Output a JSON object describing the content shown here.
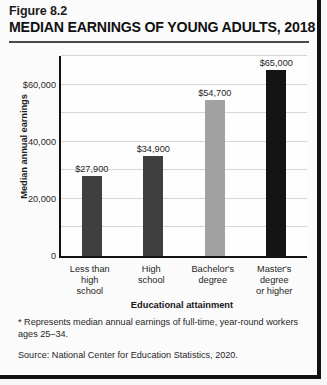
{
  "figure": {
    "number": "Figure 8.2",
    "title": "MEDIAN EARNINGS OF YOUNG ADULTS, 2018",
    "footnote": "* Represents median annual earnings of full-time, year-round workers ages 25–34.",
    "source": "Source: National Center for Education Statistics, 2020."
  },
  "chart_data": {
    "type": "bar",
    "title": "MEDIAN EARNINGS OF YOUNG ADULTS, 2018",
    "categories": [
      "Less than high school",
      "High school",
      "Bachelor's degree",
      "Master's degree or higher"
    ],
    "category_lines": [
      [
        "Less than",
        "high",
        "school"
      ],
      [
        "High",
        "school"
      ],
      [
        "Bachelor's",
        "degree"
      ],
      [
        "Master's",
        "degree",
        "or higher"
      ]
    ],
    "values": [
      27900,
      54700,
      34900,
      65000
    ],
    "values_ordered": [
      27900,
      34900,
      54700,
      65000
    ],
    "value_labels": [
      "$27,900",
      "$34,900",
      "$54,700",
      "$65,000"
    ],
    "bar_colors": [
      "#3f3f3f",
      "#3f3f3f",
      "#a2a2a2",
      "#141414"
    ],
    "xlabel": "Educational attainment",
    "ylabel": "Median annual earnings",
    "ylim": [
      0,
      70000
    ],
    "ytick_values": [
      0,
      20000,
      40000,
      60000
    ],
    "ytick_labels": [
      "0",
      "20,000",
      "40,000",
      "$60,000"
    ],
    "gridline_values": [
      10000,
      20000,
      30000,
      40000,
      50000,
      60000,
      70000
    ],
    "grid": true,
    "legend": "none"
  }
}
